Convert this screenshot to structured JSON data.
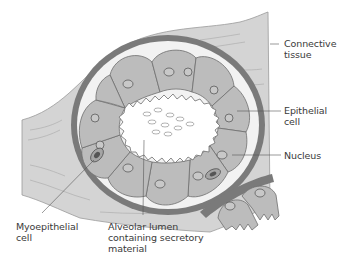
{
  "diagram": {
    "labels": {
      "connective_tissue": "Connective\ntissue",
      "epithelial_cell": "Epithelial\ncell",
      "nucleus": "Nucleus",
      "myoepithelial_cell": "Myoepithelial\ncell",
      "alveolar_lumen": "Alveolar lumen\ncontaining secretory\nmaterial"
    },
    "colors": {
      "connective_tissue": "#d4d4d4",
      "basement_ring": "#7a7a7a",
      "epithelial_cell": "#bcbcbc",
      "lumen": "#ffffff",
      "outline": "#555555",
      "text": "#3a3a3a"
    }
  }
}
